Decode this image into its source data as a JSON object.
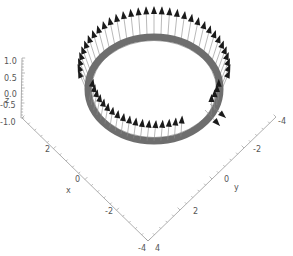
{
  "chart_data": {
    "type": "3d-vector-field",
    "title": "",
    "axes": {
      "x": {
        "label": "x",
        "range": [
          -4,
          4
        ],
        "ticks": [
          "2",
          "0",
          "-2",
          "-4"
        ]
      },
      "y": {
        "label": "y",
        "range": [
          -4,
          4
        ],
        "ticks": [
          "-4",
          "-2",
          "0",
          "2",
          "4"
        ]
      },
      "z": {
        "label": "z",
        "range": [
          -1.0,
          1.0
        ],
        "ticks": [
          "1.0",
          "0.5",
          "0.0",
          "-0.5",
          "-1.0"
        ]
      }
    },
    "ring": {
      "radius": 3,
      "z": 0,
      "color": "#6e6e6e"
    },
    "arrows": {
      "count": 60,
      "color": "#1a1a1a",
      "stem_color": "#8a8a8a"
    },
    "grid": false,
    "legend": null
  },
  "labels": {
    "z_title": "z",
    "x_title": "x",
    "y_title": "y",
    "z_ticks": [
      "1.0",
      "0.5",
      "0.0",
      "-0.5",
      "-1.0"
    ],
    "x_ticks": [
      "2",
      "0",
      "-2",
      "-4"
    ],
    "y_ticks": [
      "-4",
      "-2",
      "0",
      "2",
      "4"
    ]
  }
}
